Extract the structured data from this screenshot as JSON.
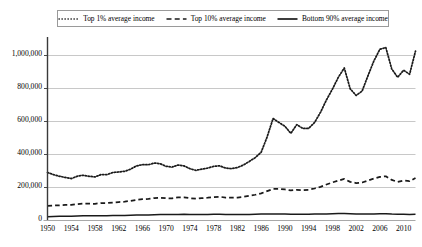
{
  "legend": {
    "position": "top-center",
    "border_color": "#9a9a9a",
    "entries": [
      {
        "label": "Top 1% average income",
        "style": "dotted",
        "color": "#1a1a1a",
        "icon": "dotted-line-icon"
      },
      {
        "label": "Top 10% average income",
        "style": "dashed",
        "color": "#1a1a1a",
        "icon": "dashed-line-icon"
      },
      {
        "label": "Bottom 90% average income",
        "style": "solid",
        "color": "#1a1a1a",
        "icon": "solid-line-icon"
      }
    ]
  },
  "chart_data": {
    "type": "line",
    "title": "",
    "subtitle": "",
    "xlabel": "",
    "ylabel": "",
    "xlim": [
      1950,
      2012
    ],
    "ylim": [
      0,
      1100000
    ],
    "grid": true,
    "grid_axis": "y",
    "grid_color": "#c8c8c8",
    "legend_position": "top-center",
    "ytick_labels": [
      "0",
      "200,000",
      "400,000",
      "600,000",
      "800,000",
      "1,000,000"
    ],
    "ytick_values": [
      0,
      200000,
      400000,
      600000,
      800000,
      1000000
    ],
    "xtick_labels": [
      "1950",
      "1954",
      "1958",
      "1962",
      "1966",
      "1970",
      "1974",
      "1978",
      "1982",
      "1986",
      "1990",
      "1994",
      "1998",
      "2002",
      "2006",
      "2010"
    ],
    "xtick_values": [
      1950,
      1954,
      1958,
      1962,
      1966,
      1970,
      1974,
      1978,
      1982,
      1986,
      1990,
      1994,
      1998,
      2002,
      2006,
      2010
    ],
    "x": [
      1950,
      1951,
      1952,
      1953,
      1954,
      1955,
      1956,
      1957,
      1958,
      1959,
      1960,
      1961,
      1962,
      1963,
      1964,
      1965,
      1966,
      1967,
      1968,
      1969,
      1970,
      1971,
      1972,
      1973,
      1974,
      1975,
      1976,
      1977,
      1978,
      1979,
      1980,
      1981,
      1982,
      1983,
      1984,
      1985,
      1986,
      1987,
      1988,
      1989,
      1990,
      1991,
      1992,
      1993,
      1994,
      1995,
      1996,
      1997,
      1998,
      1999,
      2000,
      2001,
      2002,
      2003,
      2004,
      2005,
      2006,
      2007,
      2008,
      2009,
      2010,
      2011,
      2012
    ],
    "series": [
      {
        "name": "Top 1% average income",
        "style": "dotted",
        "color": "#1a1a1a",
        "values": [
          285000,
          272000,
          262000,
          255000,
          248000,
          262000,
          268000,
          262000,
          258000,
          272000,
          272000,
          285000,
          288000,
          292000,
          305000,
          325000,
          332000,
          332000,
          342000,
          338000,
          322000,
          318000,
          330000,
          325000,
          308000,
          298000,
          305000,
          312000,
          322000,
          325000,
          312000,
          308000,
          315000,
          330000,
          352000,
          375000,
          408000,
          500000,
          612000,
          588000,
          565000,
          522000,
          575000,
          552000,
          552000,
          588000,
          650000,
          725000,
          790000,
          862000,
          918000,
          792000,
          752000,
          778000,
          872000,
          962000,
          1032000,
          1042000,
          912000,
          862000,
          905000,
          880000,
          1020000
        ]
      },
      {
        "name": "Top 10% average income",
        "style": "dashed",
        "color": "#1a1a1a",
        "values": [
          82000,
          85000,
          86000,
          88000,
          88000,
          93000,
          96000,
          96000,
          95000,
          100000,
          100000,
          103000,
          106000,
          108000,
          113000,
          119000,
          123000,
          125000,
          130000,
          132000,
          129000,
          128000,
          134000,
          134000,
          129000,
          126000,
          129000,
          132000,
          136000,
          138000,
          133000,
          132000,
          133000,
          137000,
          144000,
          150000,
          158000,
          172000,
          185000,
          186000,
          182000,
          176000,
          180000,
          178000,
          180000,
          188000,
          198000,
          212000,
          225000,
          236000,
          246000,
          228000,
          221000,
          224000,
          236000,
          248000,
          258000,
          262000,
          240000,
          228000,
          236000,
          232000,
          252000
        ]
      },
      {
        "name": "Bottom 90% average income",
        "style": "solid",
        "color": "#1a1a1a",
        "values": [
          17000,
          18000,
          19000,
          20000,
          20000,
          21000,
          22000,
          22000,
          22000,
          23000,
          23000,
          24000,
          24000,
          25000,
          26000,
          27000,
          28000,
          28000,
          29000,
          30000,
          30000,
          30000,
          31000,
          32000,
          31000,
          30000,
          31000,
          31000,
          32000,
          32000,
          31000,
          31000,
          30000,
          30000,
          31000,
          32000,
          33000,
          33000,
          33000,
          34000,
          33000,
          32000,
          32000,
          32000,
          32000,
          33000,
          33000,
          34000,
          35000,
          36000,
          36000,
          35000,
          34000,
          34000,
          34000,
          34000,
          35000,
          35000,
          33000,
          32000,
          32000,
          31000,
          32000
        ]
      }
    ]
  }
}
